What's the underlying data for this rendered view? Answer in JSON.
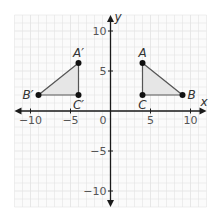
{
  "chart_data": {
    "type": "scatter",
    "title": "",
    "xlabel": "x",
    "ylabel": "y",
    "xlim": [
      -12,
      12
    ],
    "ylim": [
      -12,
      12
    ],
    "grid": true,
    "x_ticks": [
      {
        "value": -10,
        "label": "−10"
      },
      {
        "value": -5,
        "label": "−5"
      },
      {
        "value": 5,
        "label": "5"
      },
      {
        "value": 10,
        "label": "10"
      }
    ],
    "y_ticks": [
      {
        "value": 10,
        "label": "10"
      },
      {
        "value": 5,
        "label": "5"
      },
      {
        "value": -5,
        "label": "−5"
      },
      {
        "value": -10,
        "label": "−10"
      }
    ],
    "origin_label": "0",
    "shapes": [
      {
        "name": "triangle-ABC",
        "fill": "#e6e6e6",
        "points": [
          {
            "label": "A",
            "x": 4,
            "y": 6,
            "label_pos": "above"
          },
          {
            "label": "B",
            "x": 9,
            "y": 2,
            "label_pos": "right"
          },
          {
            "label": "C",
            "x": 4,
            "y": 2,
            "label_pos": "below"
          }
        ]
      },
      {
        "name": "triangle-A-prime-B-prime-C-prime",
        "fill": "#e6e6e6",
        "points": [
          {
            "label": "A′",
            "x": -4,
            "y": 6,
            "label_pos": "above"
          },
          {
            "label": "B′",
            "x": -9,
            "y": 2,
            "label_pos": "left"
          },
          {
            "label": "C′",
            "x": -4,
            "y": 2,
            "label_pos": "below"
          }
        ]
      }
    ]
  },
  "colors": {
    "axis": "#1a1a1a",
    "grid": "#e4e4e4",
    "shape_stroke": "#555555",
    "point": "#111111"
  }
}
